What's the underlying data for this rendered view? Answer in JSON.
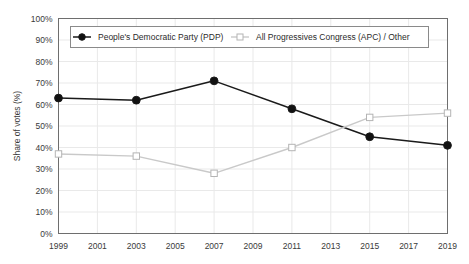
{
  "chart_data": {
    "type": "line",
    "title": "",
    "subtitle": "",
    "xlabel": "",
    "ylabel": "Share of votes (%)",
    "x": [
      1999,
      2003,
      2007,
      2011,
      2015,
      2019
    ],
    "xtick_labels": [
      "1999",
      "2001",
      "2003",
      "2005",
      "2007",
      "2009",
      "2011",
      "2013",
      "2015",
      "2017",
      "2019"
    ],
    "xtick_values": [
      1999,
      2001,
      2003,
      2005,
      2007,
      2009,
      2011,
      2013,
      2015,
      2017,
      2019
    ],
    "xlim": [
      1999,
      2019
    ],
    "ytick_labels": [
      "0%",
      "10%",
      "20%",
      "30%",
      "40%",
      "50%",
      "60%",
      "70%",
      "80%",
      "90%",
      "100%"
    ],
    "ytick_values": [
      0,
      10,
      20,
      30,
      40,
      50,
      60,
      70,
      80,
      90,
      100
    ],
    "ylim": [
      0,
      100
    ],
    "grid": true,
    "legend_position": "top-inside",
    "series": [
      {
        "name": "People's Democratic Party (PDP)",
        "values": [
          63,
          62,
          71,
          58,
          45,
          41
        ],
        "color": "#1a1a1a",
        "marker": "filled-circle",
        "marker_fill": "#111111"
      },
      {
        "name": "All Progressives Congress (APC) / Other",
        "values": [
          37,
          36,
          28,
          40,
          54,
          56
        ],
        "color": "#c9c9c9",
        "marker": "open-square",
        "marker_fill": "#ffffff"
      }
    ]
  },
  "colors": {
    "background": "#ffffff",
    "plot_border": "#6e6e6e",
    "gridline": "#e9e9e9",
    "text": "#3a3a3a",
    "legend_border": "#8a8a8a"
  }
}
